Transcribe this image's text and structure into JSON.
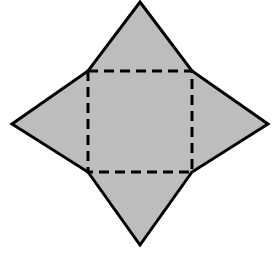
{
  "figure": {
    "name": "four-pointed-star-with-dashed-inner-square",
    "canvas": {
      "width": 280,
      "height": 259,
      "background_color": "#FFFFFF"
    },
    "style": {
      "fill_color": "#BDBDBD",
      "outline_color": "#000000",
      "outline_width": 3,
      "dash_color": "#000000",
      "dash_width": 3,
      "dash_length": 10,
      "dash_gap": 6
    },
    "star": {
      "label": "star-outline",
      "points": [
        {
          "name": "top-point",
          "x": 140,
          "y": 2
        },
        {
          "name": "upper-right-corner",
          "x": 192,
          "y": 71
        },
        {
          "name": "right-point",
          "x": 268,
          "y": 124
        },
        {
          "name": "lower-right-corner",
          "x": 192,
          "y": 172
        },
        {
          "name": "bottom-point",
          "x": 140,
          "y": 245
        },
        {
          "name": "lower-left-corner",
          "x": 88,
          "y": 172
        },
        {
          "name": "left-point",
          "x": 12,
          "y": 124
        },
        {
          "name": "upper-left-corner",
          "x": 88,
          "y": 71
        }
      ],
      "path": "M 140 2 L 192 71 L 268 124 L 192 172 L 140 245 L 88 172 L 12 124 L 88 71 Z"
    },
    "inner_square": {
      "label": "inner-square-dashed",
      "corners": [
        {
          "name": "top-left",
          "x": 88,
          "y": 71
        },
        {
          "name": "top-right",
          "x": 192,
          "y": 71
        },
        {
          "name": "bottom-right",
          "x": 192,
          "y": 172
        },
        {
          "name": "bottom-left",
          "x": 88,
          "y": 172
        }
      ],
      "width": 104,
      "height": 101,
      "path": "M 88 71 L 192 71 L 192 172 L 88 172 Z"
    },
    "triangles": [
      {
        "name": "top-triangle",
        "apex_x": 140,
        "apex_y": 2,
        "base_from_x": 88,
        "base_from_y": 71,
        "base_to_x": 192,
        "base_to_y": 71
      },
      {
        "name": "right-triangle",
        "apex_x": 268,
        "apex_y": 124,
        "base_from_x": 192,
        "base_from_y": 71,
        "base_to_x": 192,
        "base_to_y": 172
      },
      {
        "name": "bottom-triangle",
        "apex_x": 140,
        "apex_y": 245,
        "base_from_x": 192,
        "base_from_y": 172,
        "base_to_x": 88,
        "base_to_y": 172
      },
      {
        "name": "left-triangle",
        "apex_x": 12,
        "apex_y": 124,
        "base_from_x": 88,
        "base_from_y": 172,
        "base_to_x": 88,
        "base_to_y": 71
      }
    ]
  },
  "chart_data": {
    "type": "diagram",
    "title": "",
    "shape": "four-pointed star (square with four isosceles triangles)",
    "vertex_count": 8,
    "filled": true,
    "fill_color": "#BDBDBD",
    "stroke_color": "#000000",
    "hidden_edges_style": "dashed",
    "labels": [],
    "annotations": []
  }
}
